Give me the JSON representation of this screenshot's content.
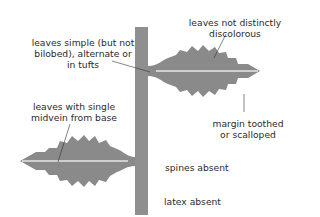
{
  "diagram": {
    "colors": {
      "stem": "#8f8f8f",
      "leaf": "#8a8a8a",
      "midvein": "#cfcfcf",
      "leader_line": "#333333",
      "text": "#2b2b2b"
    },
    "labels": {
      "leaves_simple": [
        "leaves simple (but not",
        "bilobed), alternate or",
        "in tufts"
      ],
      "not_discolorous": [
        "leaves not distinctly",
        "discolorous"
      ],
      "single_midvein": [
        "leaves with single",
        "midvein from base"
      ],
      "margin": [
        "margin toothed",
        "or scalloped"
      ],
      "spines": "spines absent",
      "latex": "latex absent"
    }
  }
}
